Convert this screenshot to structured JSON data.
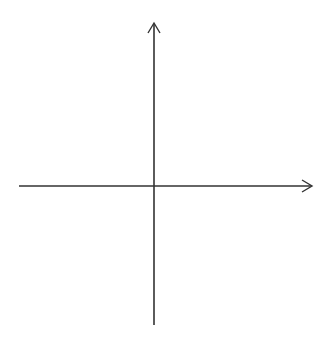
{
  "diagram": {
    "type": "coordinate-plane",
    "x_axis": {
      "label": "x",
      "min": -6,
      "max": 6,
      "tick_labels": [
        "−5",
        "−4",
        "−3",
        "−2",
        "−1",
        "1",
        "2",
        "3",
        "4",
        "5"
      ],
      "tick_values": [
        -5,
        -4,
        -3,
        -2,
        -1,
        1,
        2,
        3,
        4,
        5
      ]
    },
    "y_axis": {
      "label": "y",
      "min": -6,
      "max": 6,
      "tick_labels": [
        "5",
        "4",
        "3",
        "2",
        "1",
        "−1",
        "−2",
        "−3",
        "−4",
        "−5"
      ],
      "tick_values": [
        5,
        4,
        3,
        2,
        1,
        -1,
        -2,
        -3,
        -4,
        -5
      ]
    },
    "grid": {
      "style": "dotted",
      "cells_x": 12,
      "cells_y": 12,
      "color": "#b5b5b5"
    },
    "axis_color": "#333333"
  }
}
